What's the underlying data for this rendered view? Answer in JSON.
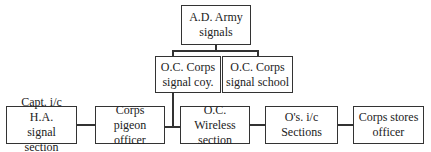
{
  "diagram": {
    "type": "organizational-chart",
    "nodes": [
      {
        "id": "ad_army_signals",
        "label": "A.D. Army\nsignals",
        "line1": "A.D. Army",
        "line2": "signals"
      },
      {
        "id": "oc_corps_signal_coy",
        "label": "O.C. Corps signal coy.",
        "line1": "O.C. Corps",
        "line2": "signal coy."
      },
      {
        "id": "oc_corps_signal_school",
        "label": "O.C. Corps signal school",
        "line1": "O.C. Corps",
        "line2": "signal school"
      },
      {
        "id": "capt_ha_signal_section",
        "label": "Capt. i/c H.A. signal section",
        "line1": "Capt. i/c H.A.",
        "line2": "signal section"
      },
      {
        "id": "corps_pigeon_officer",
        "label": "Corps pigeon officer",
        "line1": "Corps pigeon",
        "line2": "officer"
      },
      {
        "id": "oc_wireless_section",
        "label": "O.C. Wireless section",
        "line1": "O.C. Wireless",
        "line2": "section"
      },
      {
        "id": "os_ic_sections",
        "label": "O's. i/c Sections",
        "line1": "O's. i/c Sections",
        "line2": ""
      },
      {
        "id": "corps_stores_officer",
        "label": "Corps stores officer",
        "line1": "Corps stores",
        "line2": "officer"
      }
    ],
    "edges": [
      {
        "from": "ad_army_signals",
        "to": "oc_corps_signal_coy"
      },
      {
        "from": "ad_army_signals",
        "to": "oc_corps_signal_school"
      },
      {
        "from": "oc_corps_signal_coy",
        "to": "capt_ha_signal_section"
      },
      {
        "from": "oc_corps_signal_coy",
        "to": "corps_pigeon_officer"
      },
      {
        "from": "oc_corps_signal_coy",
        "to": "oc_wireless_section"
      },
      {
        "from": "oc_corps_signal_coy",
        "to": "os_ic_sections"
      },
      {
        "from": "oc_corps_signal_coy",
        "to": "corps_stores_officer"
      }
    ]
  }
}
